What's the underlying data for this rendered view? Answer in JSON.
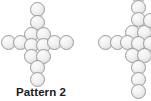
{
  "canvas": {
    "width": 151,
    "height": 101,
    "background": "#ffffff"
  },
  "style": {
    "dot_fill_light": "#fbfbfb",
    "dot_fill_mid": "#f2f2f2",
    "dot_fill_dark": "#d6d6d6",
    "dot_border": "#9b9b9b",
    "caption_color": "#1c1c1c"
  },
  "figure": {
    "patterns": [
      {
        "name": "pattern-2",
        "label": "Pattern 2",
        "shape": "cross",
        "circle_count": 16,
        "circle_diameter": 15,
        "caption": {
          "text": "Pattern 2",
          "x": 16,
          "y": 86
        },
        "circles": [
          {
            "x": 30,
            "y": 2
          },
          {
            "x": 30,
            "y": 15
          },
          {
            "x": 24,
            "y": 27
          },
          {
            "x": 36,
            "y": 27
          },
          {
            "x": 1,
            "y": 35
          },
          {
            "x": 13,
            "y": 35
          },
          {
            "x": 24,
            "y": 38
          },
          {
            "x": 36,
            "y": 38
          },
          {
            "x": 47,
            "y": 35
          },
          {
            "x": 59,
            "y": 35
          },
          {
            "x": 24,
            "y": 49
          },
          {
            "x": 36,
            "y": 49
          },
          {
            "x": 30,
            "y": 60
          },
          {
            "x": 30,
            "y": 72
          },
          {
            "x": 18,
            "y": 35
          },
          {
            "x": 42,
            "y": 35
          }
        ]
      },
      {
        "name": "pattern-3-partial",
        "label": "",
        "shape": "cross",
        "clipped": true,
        "clipped_edge": "right",
        "circle_count": 18,
        "circle_diameter": 15,
        "circles": [
          {
            "x": 131,
            "y": -12
          },
          {
            "x": 131,
            "y": 0
          },
          {
            "x": 131,
            "y": 12
          },
          {
            "x": 131,
            "y": 24
          },
          {
            "x": 125,
            "y": 27
          },
          {
            "x": 137,
            "y": 27
          },
          {
            "x": 98,
            "y": 35
          },
          {
            "x": 110,
            "y": 35
          },
          {
            "x": 119,
            "y": 35
          },
          {
            "x": 125,
            "y": 38
          },
          {
            "x": 137,
            "y": 38
          },
          {
            "x": 131,
            "y": 49
          },
          {
            "x": 131,
            "y": 61
          },
          {
            "x": 131,
            "y": 73
          },
          {
            "x": 131,
            "y": 85
          },
          {
            "x": 143,
            "y": 27
          },
          {
            "x": 143,
            "y": 38
          },
          {
            "x": 143,
            "y": 14
          }
        ]
      }
    ]
  }
}
